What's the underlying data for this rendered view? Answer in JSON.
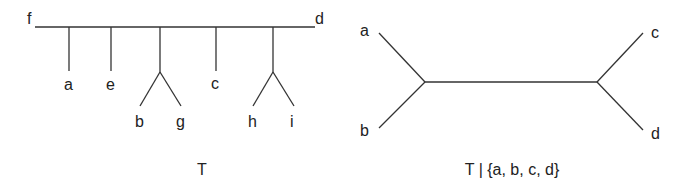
{
  "diagram": {
    "type": "phylogenetic-trees",
    "colors": {
      "edge": "#333333",
      "text": "#222222",
      "background": "#ffffff"
    },
    "left_tree": {
      "caption": "T",
      "backbone_labels": {
        "left": "f",
        "right": "d"
      },
      "pendant_labels": [
        "a",
        "e",
        "c"
      ],
      "cherries": [
        {
          "left": "b",
          "right": "g"
        },
        {
          "left": "h",
          "right": "i"
        }
      ]
    },
    "right_tree": {
      "caption": "T | {a, b, c, d}",
      "leaves": {
        "top_left": "a",
        "bottom_left": "b",
        "top_right": "c",
        "bottom_right": "d"
      }
    }
  }
}
